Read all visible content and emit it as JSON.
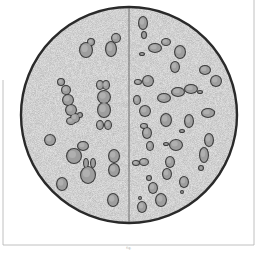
{
  "figure": {
    "caption": "fig.",
    "colors": {
      "background": "#ffffff",
      "field_fill": "#e4e4e4",
      "circle_stroke": "#2a2a2a",
      "divider": "#555555",
      "cell_fill": "#9e9e9e",
      "cell_stroke": "#3c3c3c",
      "cell_highlight": "#bdbdbd",
      "frame": "#b0b0b0"
    },
    "field": {
      "cx": 129,
      "cy": 115,
      "r": 108
    },
    "divider_x": 129,
    "frame": {
      "left_x": 3,
      "left_top": 80,
      "right_x": 254,
      "right_top": 0,
      "bottom_y": 245
    },
    "left_half_cells": [
      {
        "parts": [
          [
            86,
            50,
            7,
            8
          ],
          [
            91,
            42,
            4,
            4
          ]
        ]
      },
      {
        "parts": [
          [
            111,
            49,
            6,
            8
          ],
          [
            116,
            38,
            5,
            5
          ]
        ]
      },
      {
        "parts": [
          [
            61,
            82,
            4,
            4
          ],
          [
            66,
            90,
            5,
            5
          ],
          [
            68,
            100,
            6,
            6
          ],
          [
            71,
            110,
            6,
            6
          ],
          [
            75,
            118,
            5,
            5
          ],
          [
            71,
            121,
            5,
            4
          ],
          [
            80,
            115,
            3,
            3
          ]
        ]
      },
      {
        "parts": [
          [
            100,
            85,
            4,
            5
          ],
          [
            106,
            85,
            4,
            5
          ],
          [
            104,
            97,
            7,
            7
          ],
          [
            104,
            110,
            7,
            8
          ],
          [
            100,
            125,
            4,
            5
          ],
          [
            108,
            125,
            4,
            5
          ]
        ]
      },
      {
        "parts": [
          [
            50,
            140,
            6,
            6
          ]
        ]
      },
      {
        "parts": [
          [
            74,
            156,
            8,
            8
          ],
          [
            83,
            146,
            6,
            5
          ]
        ]
      },
      {
        "parts": [
          [
            62,
            184,
            6,
            7
          ]
        ]
      },
      {
        "parts": [
          [
            88,
            175,
            8,
            9
          ],
          [
            86,
            163,
            3,
            5
          ],
          [
            93,
            163,
            3,
            5
          ]
        ]
      },
      {
        "parts": [
          [
            114,
            156,
            6,
            7
          ],
          [
            114,
            170,
            6,
            7
          ]
        ]
      },
      {
        "parts": [
          [
            113,
            200,
            6,
            7
          ]
        ]
      }
    ],
    "right_half_cells": [
      {
        "parts": [
          [
            143,
            23,
            5,
            7
          ],
          [
            144,
            35,
            3,
            4
          ]
        ]
      },
      {
        "parts": [
          [
            142,
            54,
            3,
            2
          ],
          [
            155,
            48,
            7,
            5
          ],
          [
            166,
            42,
            5,
            4
          ]
        ]
      },
      {
        "parts": [
          [
            180,
            52,
            6,
            7
          ],
          [
            175,
            67,
            5,
            6
          ]
        ]
      },
      {
        "parts": [
          [
            205,
            70,
            6,
            5
          ],
          [
            216,
            81,
            6,
            6
          ]
        ]
      },
      {
        "parts": [
          [
            138,
            82,
            4,
            3
          ],
          [
            148,
            81,
            6,
            6
          ]
        ]
      },
      {
        "parts": [
          [
            164,
            98,
            7,
            5
          ],
          [
            178,
            92,
            7,
            5
          ],
          [
            191,
            89,
            7,
            5
          ],
          [
            200,
            92,
            3,
            2
          ]
        ]
      },
      {
        "parts": [
          [
            137,
            100,
            4,
            5
          ],
          [
            145,
            111,
            6,
            6
          ]
        ]
      },
      {
        "parts": [
          [
            166,
            120,
            6,
            7
          ]
        ]
      },
      {
        "parts": [
          [
            189,
            121,
            5,
            7
          ],
          [
            182,
            131,
            3,
            2
          ]
        ]
      },
      {
        "parts": [
          [
            208,
            113,
            7,
            5
          ],
          [
            212,
            112,
            3,
            2
          ]
        ]
      },
      {
        "parts": [
          [
            144,
            126,
            4,
            3
          ],
          [
            147,
            133,
            5,
            6
          ],
          [
            150,
            146,
            4,
            5
          ]
        ]
      },
      {
        "parts": [
          [
            166,
            144,
            3,
            2
          ],
          [
            176,
            145,
            7,
            6
          ]
        ]
      },
      {
        "parts": [
          [
            209,
            140,
            5,
            7
          ],
          [
            204,
            155,
            5,
            8
          ],
          [
            201,
            168,
            3,
            3
          ]
        ]
      },
      {
        "parts": [
          [
            136,
            163,
            4,
            3
          ],
          [
            144,
            162,
            5,
            4
          ]
        ]
      },
      {
        "parts": [
          [
            170,
            162,
            5,
            6
          ],
          [
            167,
            174,
            5,
            6
          ]
        ]
      },
      {
        "parts": [
          [
            149,
            178,
            3,
            3
          ],
          [
            153,
            188,
            5,
            6
          ],
          [
            161,
            200,
            6,
            7
          ]
        ]
      },
      {
        "parts": [
          [
            184,
            182,
            5,
            6
          ],
          [
            182,
            192,
            2,
            2
          ]
        ]
      },
      {
        "parts": [
          [
            140,
            198,
            2,
            2
          ],
          [
            142,
            207,
            5,
            6
          ]
        ]
      }
    ]
  }
}
